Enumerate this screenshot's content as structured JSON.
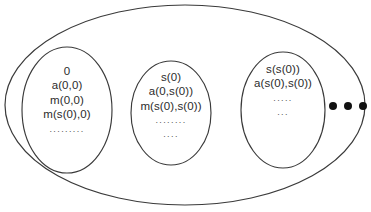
{
  "figure": {
    "title": "",
    "background_color": "#ffffff",
    "stroke_color": "#3a3a3a",
    "text_color": "#2b2b2b"
  },
  "outer_set": {
    "name": "outer-ellipse",
    "continuation_dots": [
      "dot-1",
      "dot-2",
      "dot-3"
    ]
  },
  "classes": [
    {
      "id": "class-0",
      "terms": [
        "0",
        "a(0,0)",
        "m(0,0)",
        "m(s(0),0)"
      ],
      "ellipsis": [
        "........."
      ]
    },
    {
      "id": "class-s0",
      "terms": [
        "s(0)",
        "a(0,s(0))",
        "m(s(0),s(0))"
      ],
      "ellipsis": [
        "........",
        "...."
      ]
    },
    {
      "id": "class-ss0",
      "terms": [
        "s(s(0))",
        "a(s(0),s(0))"
      ],
      "ellipsis": [
        ".....",
        "..."
      ]
    }
  ]
}
